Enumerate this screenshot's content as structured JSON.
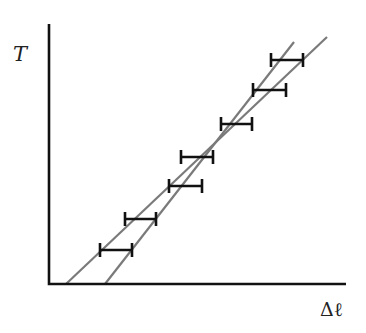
{
  "chart_data": {
    "type": "scatter",
    "title": "",
    "xlabel": "Δℓ",
    "ylabel": "T",
    "grid": false,
    "legend": null,
    "ticks": {
      "x": [],
      "y": []
    },
    "axis_pixels": {
      "origin": [
        49,
        284
      ],
      "x_end": 346,
      "y_top": 24
    },
    "points": [
      {
        "y_px": 250,
        "x_left_px": 100,
        "x_right_px": 132
      },
      {
        "y_px": 219,
        "x_left_px": 125,
        "x_right_px": 156
      },
      {
        "y_px": 186,
        "x_left_px": 169,
        "x_right_px": 202
      },
      {
        "y_px": 157,
        "x_left_px": 181,
        "x_right_px": 213
      },
      {
        "y_px": 124,
        "x_left_px": 221,
        "x_right_px": 252
      },
      {
        "y_px": 90,
        "x_left_px": 253,
        "x_right_px": 286
      },
      {
        "y_px": 60,
        "x_left_px": 271,
        "x_right_px": 303
      }
    ],
    "error_bars": "horizontal",
    "series": [
      {
        "name": "shallow-fit-line",
        "x1": 66,
        "y1": 284,
        "x2": 327,
        "y2": 37,
        "color": "#7a7a7a"
      },
      {
        "name": "steep-fit-line",
        "x1": 105,
        "y1": 284,
        "x2": 294,
        "y2": 42,
        "color": "#7a7a7a"
      }
    ],
    "annotations": []
  },
  "labels": {
    "y_axis": "T",
    "x_axis": "Δℓ"
  },
  "colors": {
    "axis": "#111111",
    "error_bar": "#111111",
    "fit_line": "#7a7a7a",
    "background": "#ffffff"
  }
}
